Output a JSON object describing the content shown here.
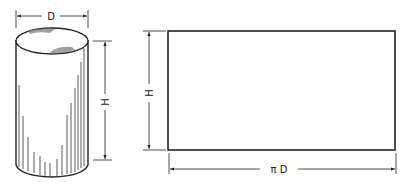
{
  "diagram": {
    "cylinder": {
      "diameter_label": "D",
      "height_label": "H"
    },
    "development": {
      "height_label": "H",
      "width_label": "π D"
    },
    "colors": {
      "line": "#222222",
      "background": "#ffffff"
    }
  }
}
